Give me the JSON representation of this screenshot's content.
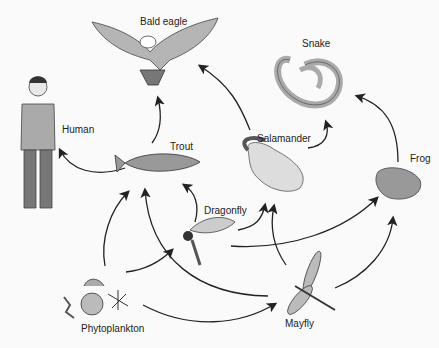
{
  "diagram": {
    "organisms": [
      {
        "id": "bald-eagle",
        "label": "Bald eagle"
      },
      {
        "id": "snake",
        "label": "Snake"
      },
      {
        "id": "human",
        "label": "Human"
      },
      {
        "id": "trout",
        "label": "Trout"
      },
      {
        "id": "salamander",
        "label": "Salamander"
      },
      {
        "id": "frog",
        "label": "Frog"
      },
      {
        "id": "dragonfly",
        "label": "Dragonfly"
      },
      {
        "id": "mayfly",
        "label": "Mayfly"
      },
      {
        "id": "phytoplankton",
        "label": "Phytoplankton"
      }
    ],
    "edges": [
      {
        "from": "Trout",
        "to": "Bald eagle"
      },
      {
        "from": "Salamander",
        "to": "Bald eagle"
      },
      {
        "from": "Trout",
        "to": "Human"
      },
      {
        "from": "Salamander",
        "to": "Snake"
      },
      {
        "from": "Frog",
        "to": "Snake"
      },
      {
        "from": "Phytoplankton",
        "to": "Trout"
      },
      {
        "from": "Dragonfly",
        "to": "Trout"
      },
      {
        "from": "Mayfly",
        "to": "Trout"
      },
      {
        "from": "Phytoplankton",
        "to": "Dragonfly"
      },
      {
        "from": "Phytoplankton",
        "to": "Mayfly"
      },
      {
        "from": "Dragonfly",
        "to": "Salamander"
      },
      {
        "from": "Mayfly",
        "to": "Salamander"
      },
      {
        "from": "Dragonfly",
        "to": "Frog"
      },
      {
        "from": "Mayfly",
        "to": "Frog"
      }
    ]
  }
}
